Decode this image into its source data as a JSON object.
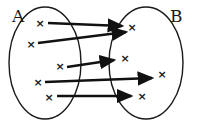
{
  "diagram": {
    "type": "mapping",
    "sets": [
      {
        "name": "A",
        "label": "A",
        "cx": 45,
        "cy": 63,
        "rx": 36,
        "ry": 56,
        "label_x": 12,
        "label_y": 22
      },
      {
        "name": "B",
        "label": "B",
        "cx": 146,
        "cy": 63,
        "rx": 37,
        "ry": 56,
        "label_x": 170,
        "label_y": 22
      }
    ],
    "elements_A": [
      {
        "x": 40,
        "y": 23
      },
      {
        "x": 31,
        "y": 44
      },
      {
        "x": 60,
        "y": 66
      },
      {
        "x": 38,
        "y": 82
      },
      {
        "x": 49,
        "y": 97
      }
    ],
    "elements_B": [
      {
        "x": 132,
        "y": 27
      },
      {
        "x": 125,
        "y": 58
      },
      {
        "x": 162,
        "y": 74
      },
      {
        "x": 142,
        "y": 96
      }
    ],
    "arrows": [
      {
        "from": 0,
        "x1": 48,
        "y1": 23,
        "x2": 122,
        "y2": 26
      },
      {
        "from": 1,
        "x1": 38,
        "y1": 43,
        "x2": 126,
        "y2": 32
      },
      {
        "from": 2,
        "x1": 67,
        "y1": 67,
        "x2": 114,
        "y2": 60
      },
      {
        "from": 3,
        "x1": 45,
        "y1": 82,
        "x2": 152,
        "y2": 78
      },
      {
        "from": 4,
        "x1": 57,
        "y1": 96,
        "x2": 131,
        "y2": 96
      }
    ],
    "cross_glyph": "×",
    "colors": {
      "stroke": "#1a1a1a",
      "background": "#ffffff"
    }
  }
}
